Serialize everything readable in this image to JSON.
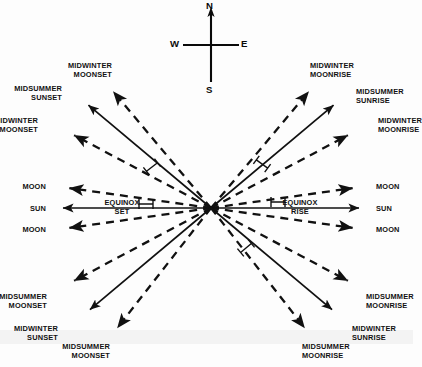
{
  "figure": {
    "background_color": "#fdfdfd",
    "ink_color": "#111111"
  },
  "compass": {
    "north": "N",
    "east": "E",
    "south": "S",
    "west": "W",
    "center_x": 211,
    "center_y": 45
  },
  "center_point": {
    "x": 211,
    "y": 208
  },
  "labels": {
    "upper_left": [
      {
        "text": "MIDWINTER\nMOONSET",
        "x": 112,
        "y": 62
      },
      {
        "text": "MIDSUMMER\nSUNSET",
        "x": 62,
        "y": 85
      },
      {
        "text": "MIDWINTER\nMOONSET",
        "x": 38,
        "y": 117
      }
    ],
    "upper_right": [
      {
        "text": "MIDWINTER\nMOONRISE",
        "x": 310,
        "y": 62
      },
      {
        "text": "MIDSUMMER\nSUNRISE",
        "x": 356,
        "y": 88
      },
      {
        "text": "MIDWINTER\nMOONRISE",
        "x": 378,
        "y": 117
      }
    ],
    "middle_left": [
      {
        "text": "MOON",
        "x": 46,
        "y": 183
      },
      {
        "text": "SUN",
        "x": 46,
        "y": 205
      },
      {
        "text": "MOON",
        "x": 46,
        "y": 226
      }
    ],
    "middle_right": [
      {
        "text": "MOON",
        "x": 376,
        "y": 183
      },
      {
        "text": "SUN",
        "x": 376,
        "y": 205
      },
      {
        "text": "MOON",
        "x": 376,
        "y": 226
      }
    ],
    "equinox_left": {
      "line1": "EQUINOX",
      "line2": "SET",
      "x": 122,
      "y": 199
    },
    "equinox_right": {
      "line1": "EQUINOX",
      "line2": "RISE",
      "x": 300,
      "y": 199
    },
    "lower_left": [
      {
        "text": "MIDSUMMER\nMOONSET",
        "x": 47,
        "y": 293
      },
      {
        "text": "MIDWINTER\nSUNSET",
        "x": 58,
        "y": 325
      },
      {
        "text": "MIDSUMMER\nMOONSET",
        "x": 110,
        "y": 343
      }
    ],
    "lower_right": [
      {
        "text": "MIDSUMMER\nMOONRISE",
        "x": 366,
        "y": 293
      },
      {
        "text": "MIDWINTER\nSUNRISE",
        "x": 352,
        "y": 325
      },
      {
        "text": "MIDSUMMER\nMOONRISE",
        "x": 302,
        "y": 343
      }
    ]
  },
  "rays": [
    {
      "name": "midwinter-moonset-upper",
      "body": "moon",
      "style": "dashed",
      "angle_deg": 130,
      "length": 152
    },
    {
      "name": "midsummer-sunset",
      "body": "sun",
      "style": "solid",
      "angle_deg": 140,
      "length": 160
    },
    {
      "name": "midwinter-moonset-lower",
      "body": "moon",
      "style": "dashed",
      "angle_deg": 152,
      "length": 155
    },
    {
      "name": "moonset-equinox-upper",
      "body": "moon",
      "style": "dashed",
      "angle_deg": 172,
      "length": 143
    },
    {
      "name": "equinox-set",
      "body": "sun",
      "style": "solid",
      "angle_deg": 180,
      "length": 148
    },
    {
      "name": "moonset-equinox-lower",
      "body": "moon",
      "style": "dashed",
      "angle_deg": 188,
      "length": 143
    },
    {
      "name": "midsummer-moonset-upper",
      "body": "moon",
      "style": "dashed",
      "angle_deg": 208,
      "length": 155
    },
    {
      "name": "midwinter-sunset",
      "body": "sun",
      "style": "solid",
      "angle_deg": 220,
      "length": 158
    },
    {
      "name": "midsummer-moonset-lower",
      "body": "moon",
      "style": "dashed",
      "angle_deg": 232,
      "length": 152
    },
    {
      "name": "midwinter-moonrise-upper",
      "body": "moon",
      "style": "dashed",
      "angle_deg": 50,
      "length": 152
    },
    {
      "name": "midsummer-sunrise",
      "body": "sun",
      "style": "solid",
      "angle_deg": 40,
      "length": 160
    },
    {
      "name": "midwinter-moonrise-lower",
      "body": "moon",
      "style": "dashed",
      "angle_deg": 28,
      "length": 155
    },
    {
      "name": "moonrise-equinox-upper",
      "body": "moon",
      "style": "dashed",
      "angle_deg": 8,
      "length": 143
    },
    {
      "name": "equinox-rise",
      "body": "sun",
      "style": "solid",
      "angle_deg": 0,
      "length": 148
    },
    {
      "name": "moonrise-equinox-lower",
      "body": "moon",
      "style": "dashed",
      "angle_deg": -8,
      "length": 143
    },
    {
      "name": "midsummer-moonrise-upper",
      "body": "moon",
      "style": "dashed",
      "angle_deg": -28,
      "length": 155
    },
    {
      "name": "midwinter-sunrise",
      "body": "sun",
      "style": "solid",
      "angle_deg": -40,
      "length": 158
    },
    {
      "name": "midsummer-moonrise-lower",
      "body": "moon",
      "style": "dashed",
      "angle_deg": -52,
      "length": 152
    }
  ],
  "angle_markers": [
    {
      "name": "angle-marker-upper-left",
      "x": 152,
      "y": 167,
      "rot": -38
    },
    {
      "name": "angle-marker-left-equinox",
      "x": 146,
      "y": 204,
      "rot": 0
    },
    {
      "name": "angle-marker-upper-right",
      "x": 262,
      "y": 164,
      "rot": 36
    },
    {
      "name": "angle-marker-right-equinox",
      "x": 278,
      "y": 202,
      "rot": 0
    },
    {
      "name": "angle-marker-lower-right",
      "x": 246,
      "y": 248,
      "rot": -40
    }
  ]
}
